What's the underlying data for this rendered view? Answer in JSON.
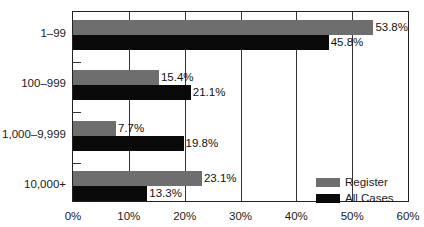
{
  "chart_data": {
    "type": "bar",
    "orientation": "horizontal",
    "title": "",
    "xlabel": "",
    "ylabel": "",
    "categories": [
      "1–99",
      "100–999",
      "1,000–9,999",
      "10,000+"
    ],
    "series": [
      {
        "name": "Register",
        "color": "#6e6e6e",
        "values": [
          53.8,
          15.4,
          7.7,
          23.1
        ],
        "labels": [
          "53.8%",
          "15.4%",
          "7.7%",
          "23.1%"
        ]
      },
      {
        "name": "All Cases",
        "color": "#0a0a0a",
        "values": [
          45.8,
          21.1,
          19.8,
          13.3
        ],
        "labels": [
          "45.8%",
          "21.1%",
          "19.8%",
          "13.3%"
        ]
      }
    ],
    "xlim": [
      0,
      60
    ],
    "x_ticks": [
      "0%",
      "10%",
      "20%",
      "30%",
      "40%",
      "50%",
      "60%"
    ],
    "grid": "vertical",
    "legend_position": "lower right"
  }
}
